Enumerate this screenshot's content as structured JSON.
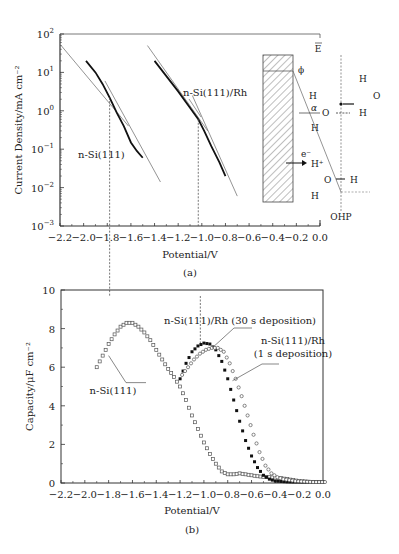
{
  "chart_data": [
    {
      "id": "a",
      "type": "line",
      "panel_label": "(a)",
      "xlabel": "Potential/V",
      "ylabel": "Current Density/mA cm⁻²",
      "yscale": "log",
      "xlim": [
        -2.2,
        0.0
      ],
      "ylim": [
        0.001,
        100
      ],
      "x_ticks": [
        "−2.2",
        "−2.0",
        "−1.8",
        "−1.6",
        "−1.4",
        "−1.2",
        "−1.0",
        "−0.8",
        "−0.6",
        "−0.4",
        "−0.2",
        "0.0"
      ],
      "y_ticks": [
        "10²",
        "10¹",
        "10⁰",
        "10⁻¹",
        "10⁻²",
        "10⁻³"
      ],
      "series": [
        {
          "name": "n-Si(111)",
          "x": [
            -1.98,
            -1.9,
            -1.84,
            -1.78,
            -1.72,
            -1.66,
            -1.6,
            -1.55,
            -1.5
          ],
          "y": [
            20,
            10,
            5,
            2.2,
            0.9,
            0.4,
            0.15,
            0.09,
            0.06
          ]
        },
        {
          "name": "n-Si(111)/Rh",
          "x": [
            -1.4,
            -1.3,
            -1.2,
            -1.1,
            -1.03,
            -0.98,
            -0.92,
            -0.85,
            -0.8
          ],
          "y": [
            20,
            8,
            3.2,
            1.2,
            0.6,
            0.3,
            0.12,
            0.045,
            0.02
          ]
        }
      ],
      "annotations": [
        {
          "text": "n-Si(111)",
          "x": -1.78,
          "note": "Tafel intersection ~ -1.78 V"
        },
        {
          "text": "n-Si(111)/Rh",
          "x": -1.03,
          "note": "Tafel intersection ~ -1.03 V"
        }
      ],
      "inset_labels": {
        "field": "E",
        "phi": "ϕ",
        "alpha": "α",
        "electron": "e⁻",
        "proton": "H⁺",
        "ohp": "OHP",
        "h": "H",
        "o": "O"
      }
    },
    {
      "id": "b",
      "type": "scatter",
      "panel_label": "(b)",
      "xlabel": "Potential/V",
      "ylabel": "Capacity/μF cm⁻²",
      "xlim": [
        -2.2,
        0.0
      ],
      "ylim": [
        0,
        10
      ],
      "x_ticks": [
        "−2.2",
        "−2.0",
        "−1.8",
        "−1.6",
        "−1.4",
        "−1.2",
        "−1.0",
        "−0.8",
        "−0.6",
        "−0.4",
        "−0.2",
        "0.0"
      ],
      "y_ticks": [
        "0",
        "2",
        "4",
        "6",
        "8",
        "10"
      ],
      "series": [
        {
          "name": "n-Si(111)",
          "marker": "open-square",
          "x": [
            -1.9,
            -1.85,
            -1.8,
            -1.75,
            -1.7,
            -1.65,
            -1.6,
            -1.55,
            -1.5,
            -1.45,
            -1.4,
            -1.35,
            -1.3,
            -1.25,
            -1.2,
            -1.15,
            -1.1,
            -1.05,
            -1.0,
            -0.95,
            -0.9,
            -0.85,
            -0.8,
            -0.75,
            -0.7,
            -0.65,
            -0.6,
            -0.55,
            -0.5,
            -0.45,
            -0.4,
            -0.35,
            -0.3,
            -0.25,
            -0.2,
            -0.15,
            -0.1,
            -0.05,
            0.0
          ],
          "y": [
            6.0,
            6.6,
            7.2,
            7.7,
            8.1,
            8.3,
            8.3,
            8.1,
            7.8,
            7.4,
            6.9,
            6.4,
            5.9,
            5.5,
            5.0,
            4.3,
            3.5,
            2.8,
            2.1,
            1.5,
            1.0,
            0.6,
            0.45,
            0.45,
            0.5,
            0.45,
            0.4,
            0.35,
            0.32,
            0.3,
            0.28,
            0.25,
            0.2,
            0.15,
            0.1,
            0.08,
            0.06,
            0.05,
            0.05
          ]
        },
        {
          "name": "n-Si(111)/Rh (30 s deposition)",
          "marker": "filled-square",
          "x": [
            -1.2,
            -1.15,
            -1.1,
            -1.05,
            -1.0,
            -0.95,
            -0.9,
            -0.85,
            -0.8,
            -0.75,
            -0.7,
            -0.65,
            -0.6,
            -0.55,
            -0.5,
            -0.45,
            -0.4,
            -0.35,
            -0.3,
            -0.25,
            -0.2,
            -0.1,
            0.0
          ],
          "y": [
            5.4,
            6.2,
            6.8,
            7.1,
            7.25,
            7.2,
            6.9,
            6.3,
            5.4,
            4.3,
            3.2,
            2.2,
            1.4,
            0.8,
            0.4,
            0.2,
            0.1,
            0.08,
            0.06,
            0.05,
            0.05,
            0.05,
            0.05
          ]
        },
        {
          "name": "n-Si(111)/Rh (1 s deposition)",
          "marker": "open-circle",
          "x": [
            -1.2,
            -1.15,
            -1.1,
            -1.05,
            -1.0,
            -0.95,
            -0.9,
            -0.85,
            -0.8,
            -0.75,
            -0.7,
            -0.65,
            -0.6,
            -0.55,
            -0.5,
            -0.45,
            -0.4,
            -0.35,
            -0.3,
            -0.25,
            -0.2,
            -0.1,
            0.0
          ],
          "y": [
            5.6,
            6.0,
            6.4,
            6.7,
            6.9,
            7.0,
            7.0,
            6.8,
            6.2,
            5.4,
            4.5,
            3.5,
            2.5,
            1.6,
            0.9,
            0.5,
            0.3,
            0.2,
            0.15,
            0.1,
            0.08,
            0.05,
            0.05
          ]
        }
      ],
      "annotations": [
        {
          "text": "n-Si(111)"
        },
        {
          "text": "n-Si(111)/Rh (30 s deposition)"
        },
        {
          "text": "n-Si(111)/Rh"
        },
        {
          "text": "(1 s deposition)"
        }
      ]
    }
  ]
}
